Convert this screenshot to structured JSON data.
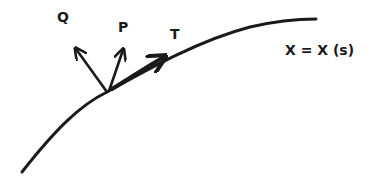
{
  "diagram": {
    "type": "curve-with-frame-vectors",
    "curve_label": "X = X (s)",
    "vectors": [
      {
        "id": "Q",
        "label": "Q"
      },
      {
        "id": "P",
        "label": "P"
      },
      {
        "id": "T",
        "label": "T"
      }
    ],
    "colors": {
      "ink": "#1a1a1a",
      "background": "#ffffff"
    }
  }
}
